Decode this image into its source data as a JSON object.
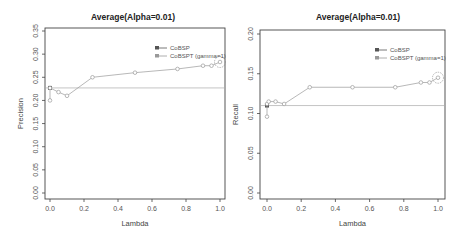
{
  "chart_data": [
    {
      "type": "line",
      "title": "Average(Alpha=0.01)",
      "xlabel": "Lambda",
      "ylabel": "Precision",
      "xlim": [
        0,
        1
      ],
      "ylim": [
        0,
        0.35
      ],
      "xticks": [
        "0.0",
        "0.2",
        "0.4",
        "0.6",
        "0.8",
        "1.0"
      ],
      "yticks": [
        "0.00",
        "0.05",
        "0.10",
        "0.15",
        "0.20",
        "0.25",
        "0.30",
        "0.35"
      ],
      "grid": false,
      "legend_position": "top-right",
      "legend": [
        "CoBSP",
        "CoBSPT (gamma=1)"
      ],
      "series": [
        {
          "name": "CoBSP",
          "style": "horizontal-line",
          "x": [
            0,
            1
          ],
          "values": [
            0.227,
            0.227
          ]
        },
        {
          "name": "CoBSPT (gamma=1)",
          "x": [
            0.0,
            0.0,
            0.05,
            0.1,
            0.25,
            0.5,
            0.75,
            0.9,
            0.95,
            1.0
          ],
          "values": [
            0.2,
            0.227,
            0.218,
            0.21,
            0.25,
            0.26,
            0.268,
            0.275,
            0.275,
            0.283
          ]
        }
      ],
      "annotations": [
        "circled maximum at Lambda=1.0"
      ]
    },
    {
      "type": "line",
      "title": "Average(Alpha=0.01)",
      "xlabel": "Lambda",
      "ylabel": "Recall",
      "xlim": [
        0,
        1
      ],
      "ylim": [
        0,
        0.2
      ],
      "xticks": [
        "0.0",
        "0.2",
        "0.4",
        "0.6",
        "0.8",
        "1.0"
      ],
      "yticks": [
        "0.00",
        "0.05",
        "0.10",
        "0.15",
        "0.20"
      ],
      "grid": false,
      "legend_position": "top-right",
      "legend": [
        "CoBSP",
        "CoBSPT (gamma=1)"
      ],
      "series": [
        {
          "name": "CoBSP",
          "style": "horizontal-line",
          "x": [
            0,
            1
          ],
          "values": [
            0.11,
            0.11
          ]
        },
        {
          "name": "CoBSPT (gamma=1)",
          "x": [
            0.0,
            0.0,
            0.01,
            0.05,
            0.1,
            0.25,
            0.5,
            0.75,
            0.9,
            0.95,
            1.0
          ],
          "values": [
            0.096,
            0.112,
            0.115,
            0.115,
            0.112,
            0.133,
            0.133,
            0.133,
            0.139,
            0.139,
            0.145
          ]
        }
      ],
      "annotations": [
        "circled maximum at Lambda=1.0"
      ]
    }
  ],
  "colors": {
    "cobsp": "#555555",
    "cobspt": "#999999",
    "axis": "#444444"
  }
}
